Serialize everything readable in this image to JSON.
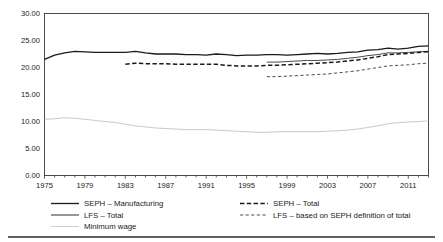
{
  "chart_data": {
    "type": "line",
    "title": "",
    "subtitle": "",
    "xlabel": "",
    "ylabel": "",
    "xlim": [
      1975,
      2013
    ],
    "ylim": [
      0,
      30
    ],
    "yticks": [
      "0.00",
      "5.00",
      "10.00",
      "15.00",
      "20.00",
      "25.00",
      "30.00"
    ],
    "ytick_values": [
      0,
      5,
      10,
      15,
      20,
      25,
      30
    ],
    "xticks": [
      "1975",
      "1979",
      "1983",
      "1987",
      "1991",
      "1995",
      "1999",
      "2003",
      "2007",
      "2011"
    ],
    "xtick_values": [
      1975,
      1979,
      1983,
      1987,
      1991,
      1995,
      1999,
      2003,
      2007,
      2011
    ],
    "minor_xticks": true,
    "grid": false,
    "legend_position": "bottom",
    "series": [
      {
        "name": "SEPH – Manufacturing",
        "style": "solid",
        "color": "#1a1a1a",
        "width": 1.3,
        "x": [
          1975,
          1976,
          1977,
          1978,
          1979,
          1980,
          1981,
          1982,
          1983,
          1984,
          1985,
          1986,
          1987,
          1988,
          1989,
          1990,
          1991,
          1992,
          1993,
          1994,
          1995,
          1996,
          1997,
          1998,
          1999,
          2000,
          2001,
          2002,
          2003,
          2004,
          2005,
          2006,
          2007,
          2008,
          2009,
          2010,
          2011,
          2012,
          2013
        ],
        "values": [
          21.5,
          22.3,
          22.7,
          23.0,
          22.9,
          22.8,
          22.8,
          22.8,
          22.8,
          23.0,
          22.7,
          22.5,
          22.5,
          22.5,
          22.4,
          22.4,
          22.3,
          22.5,
          22.4,
          22.2,
          22.3,
          22.3,
          22.4,
          22.4,
          22.3,
          22.4,
          22.5,
          22.6,
          22.5,
          22.6,
          22.8,
          22.9,
          23.2,
          23.3,
          23.6,
          23.4,
          23.6,
          23.9,
          24.0
        ]
      },
      {
        "name": "SEPH – Total",
        "style": "dashed",
        "color": "#1a1a1a",
        "width": 1.5,
        "x": [
          1983,
          1984,
          1985,
          1986,
          1987,
          1988,
          1989,
          1990,
          1991,
          1992,
          1993,
          1994,
          1995,
          1996,
          1997,
          1998,
          1999,
          2000,
          2001,
          2002,
          2003,
          2004,
          2005,
          2006,
          2007,
          2008,
          2009,
          2010,
          2011,
          2012,
          2013
        ],
        "values": [
          20.6,
          20.8,
          20.7,
          20.7,
          20.7,
          20.6,
          20.6,
          20.6,
          20.6,
          20.6,
          20.4,
          20.3,
          20.3,
          20.3,
          20.4,
          20.4,
          20.5,
          20.6,
          20.7,
          20.8,
          20.9,
          21.0,
          21.2,
          21.4,
          21.7,
          22.0,
          22.4,
          22.5,
          22.6,
          22.8,
          22.9
        ]
      },
      {
        "name": "LFS – Total",
        "style": "solid",
        "color": "#1a1a1a",
        "width": 0.8,
        "x": [
          1997,
          1998,
          1999,
          2000,
          2001,
          2002,
          2003,
          2004,
          2005,
          2006,
          2007,
          2008,
          2009,
          2010,
          2011,
          2012,
          2013
        ],
        "values": [
          21.0,
          21.0,
          21.1,
          21.2,
          21.3,
          21.3,
          21.4,
          21.5,
          21.7,
          21.9,
          22.2,
          22.4,
          22.7,
          22.7,
          22.8,
          22.9,
          23.0
        ]
      },
      {
        "name": "LFS – based on SEPH definition of total",
        "style": "dashed-fine",
        "color": "#3a3a3a",
        "width": 0.9,
        "x": [
          1997,
          1998,
          1999,
          2000,
          2001,
          2002,
          2003,
          2004,
          2005,
          2006,
          2007,
          2008,
          2009,
          2010,
          2011,
          2012,
          2013
        ],
        "values": [
          18.3,
          18.3,
          18.4,
          18.5,
          18.6,
          18.7,
          18.8,
          19.0,
          19.2,
          19.4,
          19.7,
          20.0,
          20.3,
          20.4,
          20.5,
          20.7,
          20.8
        ]
      },
      {
        "name": "Minimum wage",
        "style": "solid-light",
        "color": "#c9c9c9",
        "width": 1.0,
        "x": [
          1975,
          1976,
          1977,
          1978,
          1979,
          1980,
          1981,
          1982,
          1983,
          1984,
          1985,
          1986,
          1987,
          1988,
          1989,
          1990,
          1991,
          1992,
          1993,
          1994,
          1995,
          1996,
          1997,
          1998,
          1999,
          2000,
          2001,
          2002,
          2003,
          2004,
          2005,
          2006,
          2007,
          2008,
          2009,
          2010,
          2011,
          2012,
          2013
        ],
        "values": [
          10.4,
          10.5,
          10.7,
          10.6,
          10.4,
          10.2,
          10.0,
          9.8,
          9.5,
          9.2,
          9.0,
          8.8,
          8.7,
          8.6,
          8.5,
          8.5,
          8.5,
          8.4,
          8.3,
          8.2,
          8.1,
          8.0,
          8.0,
          8.1,
          8.1,
          8.1,
          8.1,
          8.1,
          8.2,
          8.3,
          8.4,
          8.6,
          8.9,
          9.2,
          9.6,
          9.8,
          9.9,
          10.0,
          10.1
        ]
      }
    ]
  },
  "legend": {
    "column_left": [
      {
        "label": "SEPH – Manufacturing",
        "style": "solid",
        "color": "#1a1a1a"
      },
      {
        "label": "LFS – Total",
        "style": "solid-thin",
        "color": "#1a1a1a"
      },
      {
        "label": "Minimum wage",
        "style": "solid-light",
        "color": "#c9c9c9"
      }
    ],
    "column_right": [
      {
        "label": "SEPH – Total",
        "style": "dashed",
        "color": "#1a1a1a"
      },
      {
        "label": "LFS – based on SEPH definition of total",
        "style": "dashed-fine",
        "color": "#3a3a3a"
      }
    ]
  }
}
